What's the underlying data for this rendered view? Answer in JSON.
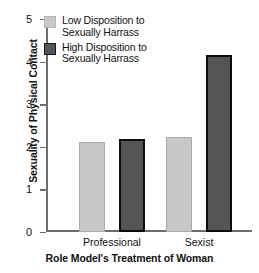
{
  "chart_data": {
    "type": "bar",
    "title": "",
    "xlabel": "Role Model's Treatment of Woman",
    "ylabel": "Sexuality of Physical Contact",
    "categories": [
      "Professional",
      "Sexist"
    ],
    "series": [
      {
        "name": "Low Disposition to Sexually Harrass",
        "color": "#c8c8c8",
        "border_color": "#a9a9a9",
        "values": [
          2.12,
          2.24
        ]
      },
      {
        "name": "High Disposition to Sexually Harrass",
        "color": "#555555",
        "border_color": "#0d0d0d",
        "values": [
          2.19,
          4.15
        ]
      }
    ],
    "ylim": [
      0,
      5
    ],
    "yticks": [
      0,
      1,
      2,
      3,
      4,
      5
    ],
    "ytick_labels": [
      "0",
      "1",
      "2",
      "3",
      "4",
      "5"
    ],
    "grid": false,
    "legend_position": "top-left"
  },
  "legend": {
    "entries": [
      {
        "label_line1": "Low Disposition to",
        "label_line2": "Sexually Harrass"
      },
      {
        "label_line1": "High Disposition to",
        "label_line2": "Sexually Harrass"
      }
    ]
  }
}
